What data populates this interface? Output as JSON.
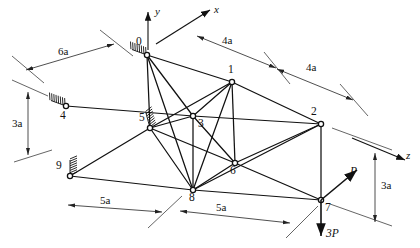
{
  "figure": {
    "type": "engineering-diagram"
  },
  "axes": [
    {
      "name": "y-axis",
      "label": "y",
      "x1": 148,
      "y1": 50,
      "x2": 148,
      "y2": 12,
      "lx": 155,
      "ly": 6
    },
    {
      "name": "x-axis",
      "label": "x",
      "x1": 156,
      "y1": 44,
      "x2": 210,
      "y2": 10,
      "lx": 214,
      "ly": 4
    },
    {
      "name": "z-axis",
      "label": "z",
      "x1": 352,
      "y1": 138,
      "x2": 405,
      "y2": 160,
      "lx": 406,
      "ly": 150
    }
  ],
  "joints": [
    {
      "id": "0",
      "x": 147,
      "y": 55,
      "lx": 136,
      "ly": 36,
      "support": true
    },
    {
      "id": "1",
      "x": 232,
      "y": 82,
      "lx": 228,
      "ly": 64,
      "support": false
    },
    {
      "id": "2",
      "x": 321,
      "y": 124,
      "lx": 311,
      "ly": 106,
      "support": false
    },
    {
      "id": "3",
      "x": 193,
      "y": 116,
      "lx": 198,
      "ly": 118,
      "support": false
    },
    {
      "id": "4",
      "x": 66,
      "y": 106,
      "lx": 60,
      "ly": 110,
      "support": true
    },
    {
      "id": "5",
      "x": 150,
      "y": 128,
      "lx": 139,
      "ly": 112,
      "support": true
    },
    {
      "id": "6",
      "x": 235,
      "y": 163,
      "lx": 230,
      "ly": 165,
      "support": false
    },
    {
      "id": "7",
      "x": 321,
      "y": 200,
      "lx": 325,
      "ly": 202,
      "support": false
    },
    {
      "id": "8",
      "x": 193,
      "y": 190,
      "lx": 189,
      "ly": 192,
      "support": false
    },
    {
      "id": "9",
      "x": 70,
      "y": 176,
      "lx": 56,
      "ly": 160,
      "support": true
    }
  ],
  "members": [
    {
      "from": "0",
      "to": "1"
    },
    {
      "from": "0",
      "to": "3"
    },
    {
      "from": "0",
      "to": "5"
    },
    {
      "from": "0",
      "to": "8"
    },
    {
      "from": "1",
      "to": "2"
    },
    {
      "from": "1",
      "to": "3"
    },
    {
      "from": "1",
      "to": "6"
    },
    {
      "from": "1",
      "to": "8"
    },
    {
      "from": "1",
      "to": "5"
    },
    {
      "from": "2",
      "to": "3"
    },
    {
      "from": "2",
      "to": "6"
    },
    {
      "from": "2",
      "to": "7"
    },
    {
      "from": "2",
      "to": "8"
    },
    {
      "from": "3",
      "to": "5"
    },
    {
      "from": "3",
      "to": "6"
    },
    {
      "from": "3",
      "to": "8"
    },
    {
      "from": "3",
      "to": "4"
    },
    {
      "from": "5",
      "to": "6"
    },
    {
      "from": "5",
      "to": "8"
    },
    {
      "from": "5",
      "to": "9"
    },
    {
      "from": "6",
      "to": "7"
    },
    {
      "from": "6",
      "to": "8"
    },
    {
      "from": "7",
      "to": "8"
    },
    {
      "from": "8",
      "to": "9"
    }
  ],
  "dimensions": [
    {
      "name": "dim-6a",
      "label": "6a",
      "x1": 26,
      "y1": 70,
      "x2": 114,
      "y2": 44,
      "lx": 58,
      "ly": 46
    },
    {
      "name": "dim-4a-upper-left",
      "label": "4a",
      "x1": 197,
      "y1": 36,
      "x2": 276,
      "y2": 68,
      "lx": 222,
      "ly": 35
    },
    {
      "name": "dim-4a-upper-right",
      "label": "4a",
      "x1": 277,
      "y1": 69,
      "x2": 353,
      "y2": 100,
      "lx": 306,
      "ly": 62
    },
    {
      "name": "dim-3a-left",
      "label": "3a",
      "x1": 28,
      "y1": 92,
      "x2": 28,
      "y2": 155,
      "lx": 12,
      "ly": 118
    },
    {
      "name": "dim-5a-lower-left",
      "label": "5a",
      "x1": 68,
      "y1": 205,
      "x2": 162,
      "y2": 212,
      "lx": 100,
      "ly": 195
    },
    {
      "name": "dim-5a-lower-right",
      "label": "5a",
      "x1": 180,
      "y1": 211,
      "x2": 290,
      "y2": 223,
      "lx": 216,
      "ly": 202
    },
    {
      "name": "dim-3a-right",
      "label": "3a",
      "x1": 375,
      "y1": 153,
      "x2": 375,
      "y2": 222,
      "lx": 381,
      "ly": 180
    }
  ],
  "ext_lines": [
    {
      "name": "ext-6a-upper",
      "x1": 100,
      "y1": 30,
      "x2": 133,
      "y2": 56
    },
    {
      "name": "ext-6a-lower",
      "x1": 12,
      "y1": 56,
      "x2": 44,
      "y2": 83
    },
    {
      "name": "ext-4a-mid",
      "x1": 264,
      "y1": 52,
      "x2": 290,
      "y2": 84
    },
    {
      "name": "ext-4a-right",
      "x1": 340,
      "y1": 84,
      "x2": 368,
      "y2": 116
    },
    {
      "name": "ext-3a-left-top",
      "x1": 12,
      "y1": 80,
      "x2": 48,
      "y2": 96
    },
    {
      "name": "ext-3a-left-bot",
      "x1": 14,
      "y1": 162,
      "x2": 52,
      "y2": 150
    },
    {
      "name": "ext-5a-mid",
      "x1": 148,
      "y1": 228,
      "x2": 182,
      "y2": 196
    },
    {
      "name": "ext-5a-right",
      "x1": 286,
      "y1": 238,
      "x2": 318,
      "y2": 206
    },
    {
      "name": "ext-3a-right-top",
      "x1": 332,
      "y1": 128,
      "x2": 392,
      "y2": 150
    },
    {
      "name": "ext-3a-right-bot",
      "x1": 330,
      "y1": 204,
      "x2": 392,
      "y2": 226
    }
  ],
  "loads": [
    {
      "name": "load-P",
      "label": "P",
      "x1": 321,
      "y1": 200,
      "x2": 357,
      "y2": 170,
      "lx": 350,
      "ly": 166
    },
    {
      "name": "load-3P",
      "label": "3P",
      "x1": 321,
      "y1": 200,
      "x2": 321,
      "y2": 236,
      "lx": 326,
      "ly": 228
    }
  ],
  "supports": [
    {
      "name": "support-0",
      "x": 147,
      "y": 55,
      "angle": 200
    },
    {
      "name": "support-4",
      "x": 66,
      "y": 106,
      "angle": 200
    },
    {
      "name": "support-5",
      "x": 150,
      "y": 128,
      "angle": 255
    },
    {
      "name": "support-9",
      "x": 70,
      "y": 176,
      "angle": 270
    }
  ],
  "colors": {
    "ink": "#111111",
    "paper": "#ffffff"
  }
}
